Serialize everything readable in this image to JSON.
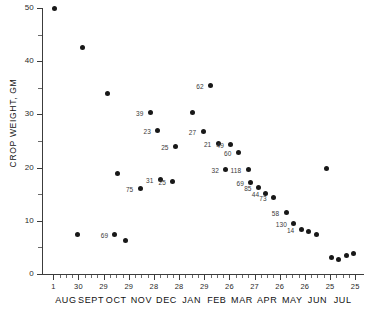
{
  "chart_data": {
    "type": "scatter",
    "title": "",
    "xlabel": "",
    "ylabel": "CROP WEIGHT, GM",
    "ylim": [
      0,
      50
    ],
    "y_ticks": [
      0,
      10,
      20,
      30,
      40,
      50
    ],
    "y_tick_labels": [
      "0",
      "10",
      "20",
      "30",
      "40",
      "50"
    ],
    "y_minor_ticks": [
      5,
      15,
      25,
      35,
      45
    ],
    "grid": false,
    "legend": null,
    "x_axis": {
      "day_labels": [
        "1",
        "30",
        "29",
        "29",
        "28",
        "28",
        "29",
        "26",
        "27",
        "26",
        "26",
        "25",
        "25"
      ],
      "month_labels": [
        "AUG",
        "SEPT",
        "OCT",
        "NOV",
        "DEC",
        "JAN",
        "FEB",
        "MAR",
        "APR",
        "MAY",
        "JUN",
        "JUL"
      ]
    },
    "point_label_note": "numbers adjacent to markers are sample sizes (n)",
    "points": [
      {
        "x": 0.5,
        "y": 50.0,
        "label": ""
      },
      {
        "x": 1.6,
        "y": 42.6,
        "label": ""
      },
      {
        "x": 2.6,
        "y": 34.0,
        "label": ""
      },
      {
        "x": 1.4,
        "y": 7.4,
        "label": ""
      },
      {
        "x": 3.3,
        "y": 6.3,
        "label": ""
      },
      {
        "x": 3.0,
        "y": 18.9,
        "label": ""
      },
      {
        "x": 3.9,
        "y": 16.0,
        "label": "75"
      },
      {
        "x": 2.9,
        "y": 7.5,
        "label": "69"
      },
      {
        "x": 4.3,
        "y": 30.3,
        "label": "39"
      },
      {
        "x": 4.6,
        "y": 27.0,
        "label": "23"
      },
      {
        "x": 5.3,
        "y": 24.0,
        "label": "25"
      },
      {
        "x": 4.7,
        "y": 17.8,
        "label": "31"
      },
      {
        "x": 5.2,
        "y": 17.4,
        "label": "25"
      },
      {
        "x": 6.0,
        "y": 30.4,
        "label": ""
      },
      {
        "x": 6.4,
        "y": 26.7,
        "label": "27"
      },
      {
        "x": 6.7,
        "y": 35.4,
        "label": "62"
      },
      {
        "x": 7.0,
        "y": 24.6,
        "label": "21"
      },
      {
        "x": 7.5,
        "y": 24.3,
        "label": "49"
      },
      {
        "x": 7.3,
        "y": 19.6,
        "label": "32"
      },
      {
        "x": 7.8,
        "y": 22.8,
        "label": "60"
      },
      {
        "x": 8.2,
        "y": 19.6,
        "label": "118"
      },
      {
        "x": 8.3,
        "y": 17.2,
        "label": "69"
      },
      {
        "x": 8.6,
        "y": 16.3,
        "label": "85"
      },
      {
        "x": 8.9,
        "y": 15.2,
        "label": "44"
      },
      {
        "x": 9.2,
        "y": 14.4,
        "label": "73"
      },
      {
        "x": 9.7,
        "y": 11.6,
        "label": "58"
      },
      {
        "x": 10.0,
        "y": 9.5,
        "label": "130"
      },
      {
        "x": 10.3,
        "y": 8.4,
        "label": "14"
      },
      {
        "x": 10.6,
        "y": 8.0,
        "label": ""
      },
      {
        "x": 10.9,
        "y": 7.5,
        "label": ""
      },
      {
        "x": 11.3,
        "y": 19.9,
        "label": ""
      },
      {
        "x": 11.5,
        "y": 3.1,
        "label": ""
      },
      {
        "x": 11.8,
        "y": 2.7,
        "label": ""
      },
      {
        "x": 12.1,
        "y": 3.5,
        "label": ""
      },
      {
        "x": 12.4,
        "y": 3.9,
        "label": ""
      }
    ]
  }
}
